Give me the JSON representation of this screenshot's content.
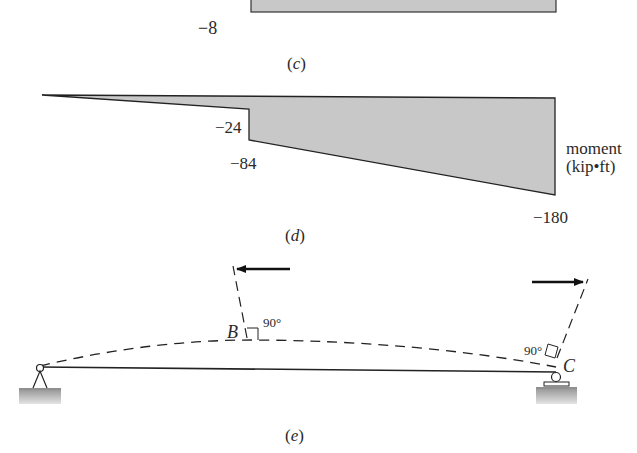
{
  "figure": {
    "panel_c": {
      "caption_open": "(",
      "caption_letter": "c",
      "caption_close": ")",
      "min_value_label": "−8",
      "fill_color": "#c8c8c8"
    },
    "panel_d": {
      "caption_open": "(",
      "caption_letter": "d",
      "caption_close": ")",
      "value_labels": {
        "step_top": "−24",
        "step_bottom": "−84",
        "right_end": "−180"
      },
      "axis_label_line1": "moment",
      "axis_label_line2": "(kip•ft)",
      "fill_color": "#c8c8c8"
    },
    "panel_e": {
      "caption_open": "(",
      "caption_letter": "e",
      "caption_close": ")",
      "point_B": "B",
      "point_C": "C",
      "angle_B": "90°",
      "angle_C": "90°",
      "ground_color": "#a8a8a8"
    }
  }
}
